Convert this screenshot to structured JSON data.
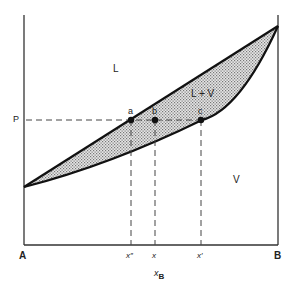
{
  "diagram": {
    "type": "binary phase diagram (vapor pressure vs composition)",
    "axis_left_label": "A",
    "axis_right_label": "B",
    "x_axis_label": "x",
    "x_axis_subscript": "B",
    "y_level_label": "P",
    "regions": {
      "liquid": "L",
      "two_phase": "L + V",
      "vapor": "V"
    },
    "points": [
      {
        "label": "a",
        "x_label": "x″"
      },
      {
        "label": "b",
        "x_label": "x"
      },
      {
        "label": "c",
        "x_label": "x′"
      }
    ],
    "colors": {
      "line": "#1a1a1a",
      "shading": "#bdbdbd",
      "axis": "#555555"
    }
  }
}
